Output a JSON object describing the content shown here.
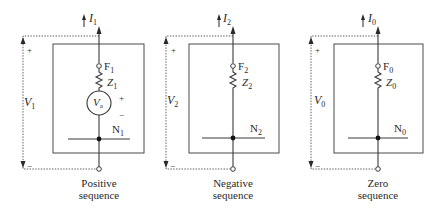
{
  "diagram": {
    "networks": [
      {
        "id": "positive",
        "current_label": "I",
        "current_sub": "1",
        "voltage_label": "V",
        "voltage_sub": "1",
        "plus": "+",
        "minus": "−",
        "fault_label": "F",
        "fault_sub": "1",
        "impedance_label": "Z",
        "impedance_sub": "1",
        "source_label": "V",
        "source_sub": "a",
        "source_plus": "+",
        "source_minus": "−",
        "neutral_label": "N",
        "neutral_sub": "1",
        "caption_line1": "Positive",
        "caption_line2": "sequence"
      },
      {
        "id": "negative",
        "current_label": "I",
        "current_sub": "2",
        "voltage_label": "V",
        "voltage_sub": "2",
        "plus": "+",
        "minus": "−",
        "fault_label": "F",
        "fault_sub": "2",
        "impedance_label": "Z",
        "impedance_sub": "2",
        "neutral_label": "N",
        "neutral_sub": "2",
        "caption_line1": "Negative",
        "caption_line2": "sequence"
      },
      {
        "id": "zero",
        "current_label": "I",
        "current_sub": "0",
        "voltage_label": "V",
        "voltage_sub": "0",
        "plus": "+",
        "minus": "−",
        "fault_label": "F",
        "fault_sub": "0",
        "impedance_label": "Z",
        "impedance_sub": "0",
        "neutral_label": "N",
        "neutral_sub": "0",
        "caption_line1": "Zero",
        "caption_line2": "sequence"
      }
    ]
  }
}
